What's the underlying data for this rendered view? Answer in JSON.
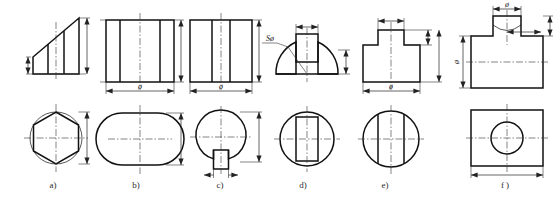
{
  "document": {
    "kind": "engineering-drawing-plate",
    "width": 559,
    "height": 204,
    "background_color": "#ffffff",
    "line_color": "#111111",
    "thin_line_color": "#333333"
  },
  "symbols": {
    "diameter": "ø",
    "spherical_diameter": "Sø"
  },
  "figures": [
    {
      "id": "a",
      "caption": "a)",
      "caption_x": 53,
      "caption_y": 188,
      "front_view": "stepped-wedge-profile",
      "top_view": "hexagon-in-circle",
      "dimensions": [
        {
          "name": "height-left",
          "label": "",
          "orientation": "vertical"
        },
        {
          "name": "height-right",
          "label": "",
          "orientation": "vertical"
        },
        {
          "name": "across-corners",
          "label": "",
          "orientation": "vertical"
        }
      ]
    },
    {
      "id": "b",
      "caption": "b)",
      "caption_x": 136,
      "caption_y": 188,
      "front_view": "rectangular-block-with-two-cut-lines",
      "top_view": "circle-with-two-flats",
      "dimensions": [
        {
          "name": "height",
          "label": "",
          "orientation": "vertical"
        },
        {
          "name": "diameter",
          "label": "ø",
          "orientation": "horizontal"
        },
        {
          "name": "across-flats",
          "label": "",
          "orientation": "vertical"
        }
      ]
    },
    {
      "id": "c",
      "caption": "c)",
      "caption_x": 220,
      "caption_y": 188,
      "front_view": "rectangular-block-with-slot-lines",
      "top_view": "circle-with-bottom-keyway",
      "dimensions": [
        {
          "name": "height",
          "label": "",
          "orientation": "vertical"
        },
        {
          "name": "diameter",
          "label": "ø",
          "orientation": "horizontal"
        },
        {
          "name": "depth",
          "label": "",
          "orientation": "vertical"
        },
        {
          "name": "keyway-width",
          "label": "",
          "orientation": "horizontal"
        }
      ]
    },
    {
      "id": "d",
      "caption": "d)",
      "caption_x": 303,
      "caption_y": 188,
      "front_view": "hemisphere-dome-with-rectangular-slot",
      "top_view": "circle-with-inner-rectangle",
      "dimensions": [
        {
          "name": "spherical-diameter",
          "label": "Sø",
          "orientation": "leader"
        },
        {
          "name": "slot-width",
          "label": "",
          "orientation": "horizontal"
        },
        {
          "name": "dome-height",
          "label": "",
          "orientation": "vertical"
        }
      ]
    },
    {
      "id": "e",
      "caption": "e)",
      "caption_x": 385,
      "caption_y": 188,
      "front_view": "stepped-tee-profile",
      "top_view": "circle-with-two-vertical-lines",
      "dimensions": [
        {
          "name": "boss-width",
          "label": "",
          "orientation": "horizontal"
        },
        {
          "name": "boss-height",
          "label": "",
          "orientation": "vertical"
        },
        {
          "name": "total-height",
          "label": "",
          "orientation": "vertical"
        },
        {
          "name": "diameter",
          "label": "ø",
          "orientation": "horizontal"
        }
      ]
    },
    {
      "id": "f",
      "caption": "f )",
      "caption_x": 505,
      "caption_y": 188,
      "front_view": "block-with-cylindrical-boss-and-curved-intersection",
      "top_view": "rectangle-with-centered-circle",
      "dimensions": [
        {
          "name": "boss-diameter",
          "label": "ø",
          "orientation": "horizontal"
        },
        {
          "name": "block-height",
          "label": "ø",
          "orientation": "vertical"
        },
        {
          "name": "intersection-depth",
          "label": "",
          "orientation": "horizontal"
        },
        {
          "name": "block-width",
          "label": "",
          "orientation": "horizontal"
        }
      ]
    }
  ]
}
